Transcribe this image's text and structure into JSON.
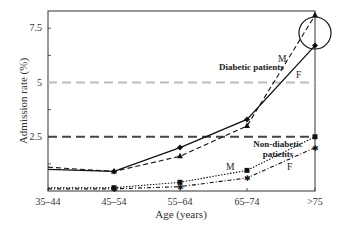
{
  "chart_data": {
    "type": "line",
    "title": "",
    "xlabel": "Age (years)",
    "ylabel": "Admission rate (%)",
    "categories": [
      "35–44",
      "45–54",
      "55–64",
      "65–74",
      ">75"
    ],
    "yticks": [
      "2.5",
      "5",
      "7.5"
    ],
    "ylim": [
      0,
      8.5
    ],
    "grid": false,
    "series": [
      {
        "name": "Diabetic patients M",
        "group": "Diabetic patients",
        "sex": "M",
        "marker": "triangle",
        "style": "dashed",
        "values": [
          1.1,
          0.9,
          1.6,
          3.0,
          8.1
        ]
      },
      {
        "name": "Diabetic patients F",
        "group": "Diabetic patients",
        "sex": "F",
        "marker": "diamond",
        "style": "solid",
        "values": [
          1.0,
          0.9,
          2.0,
          3.3,
          6.7
        ]
      },
      {
        "name": "Non-diabetic patients M",
        "group": "Non-diabetic patients",
        "sex": "M",
        "marker": "square",
        "style": "dotted",
        "values": [
          0.15,
          0.15,
          0.4,
          0.95,
          2.5
        ]
      },
      {
        "name": "Non-diabetic patients F",
        "group": "Non-diabetic patients",
        "sex": "F",
        "marker": "star",
        "style": "dash-dot",
        "values": [
          0.1,
          0.1,
          0.2,
          0.6,
          2.0
        ]
      }
    ],
    "reference_lines": [
      {
        "value": 5,
        "color": "#bbbbbb",
        "style": "dashed"
      },
      {
        "value": 2.5,
        "color": "#444444",
        "style": "dashed"
      }
    ],
    "annotations": [
      "Diabetic patients",
      "Non-diabetic patients",
      "M",
      "F",
      "M",
      "F"
    ],
    "highlight": {
      "type": "circle",
      "category": ">75",
      "target": "Diabetic patients"
    }
  },
  "labels": {
    "diabetic": "Diabetic patients",
    "nondiabetic_1": "Non-diabetic",
    "nondiabetic_2": "patients",
    "m": "M",
    "f": "F"
  }
}
